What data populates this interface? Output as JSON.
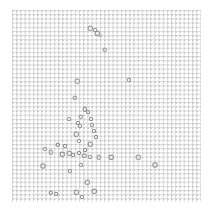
{
  "figure": {
    "width": 211,
    "height": 212,
    "background_color": "#ffffff",
    "title": "",
    "xlabel": "",
    "ylabel": ""
  },
  "plot_area": {
    "left": 12,
    "top": 10,
    "width": 189,
    "height": 192,
    "grid": true,
    "grid_color": "#d5d5d5",
    "grid_spacing_px": 4.2,
    "frame_visible": false
  },
  "chart_data": {
    "type": "scatter",
    "title": "",
    "subtitle": "",
    "xlabel": "",
    "ylabel": "",
    "xlim": [
      0,
      100
    ],
    "ylim": [
      0,
      100
    ],
    "xticklabels": [],
    "yticklabels": [],
    "grid": true,
    "legend": null,
    "legend_position": "none",
    "marker": "square-open",
    "marker_color": "#808080",
    "marker_edge_color": "#6e6e6e",
    "series": [
      {
        "name": "points",
        "color": "#808080",
        "points": [
          {
            "x": 41.3,
            "y": 90.6,
            "size": 4.5,
            "shade": "#8d8d8d"
          },
          {
            "x": 43.9,
            "y": 89.6,
            "size": 4.0,
            "shade": "#9a9a9a"
          },
          {
            "x": 45.2,
            "y": 88.0,
            "size": 4.5,
            "shade": "#838383"
          },
          {
            "x": 46.6,
            "y": 86.5,
            "size": 3.5,
            "shade": "#a5a5a5"
          },
          {
            "x": 49.2,
            "y": 79.2,
            "size": 4.5,
            "shade": "#8a8a8a"
          },
          {
            "x": 34.4,
            "y": 63.0,
            "size": 4.5,
            "shade": "#8f8f8f"
          },
          {
            "x": 61.9,
            "y": 63.5,
            "size": 4.0,
            "shade": "#969696"
          },
          {
            "x": 33.3,
            "y": 54.2,
            "size": 4.5,
            "shade": "#898989"
          },
          {
            "x": 38.6,
            "y": 48.4,
            "size": 4.5,
            "shade": "#7f7f7f"
          },
          {
            "x": 40.2,
            "y": 46.9,
            "size": 4.0,
            "shade": "#8c8c8c"
          },
          {
            "x": 36.5,
            "y": 44.3,
            "size": 4.5,
            "shade": "#888888"
          },
          {
            "x": 41.8,
            "y": 43.2,
            "size": 4.0,
            "shade": "#929292"
          },
          {
            "x": 43.4,
            "y": 37.0,
            "size": 4.0,
            "shade": "#919191"
          },
          {
            "x": 33.9,
            "y": 35.4,
            "size": 4.5,
            "shade": "#858585"
          },
          {
            "x": 35.4,
            "y": 31.8,
            "size": 4.0,
            "shade": "#9b9b9b"
          },
          {
            "x": 41.3,
            "y": 30.2,
            "size": 4.5,
            "shade": "#878787"
          },
          {
            "x": 24.3,
            "y": 29.7,
            "size": 4.5,
            "shade": "#7e7e7e"
          },
          {
            "x": 28.0,
            "y": 29.2,
            "size": 4.0,
            "shade": "#8b8b8b"
          },
          {
            "x": 17.5,
            "y": 27.6,
            "size": 4.0,
            "shade": "#999999"
          },
          {
            "x": 20.6,
            "y": 26.0,
            "size": 4.5,
            "shade": "#8e8e8e"
          },
          {
            "x": 26.5,
            "y": 25.0,
            "size": 4.5,
            "shade": "#7d7d7d"
          },
          {
            "x": 30.2,
            "y": 25.5,
            "size": 4.5,
            "shade": "#848484"
          },
          {
            "x": 32.3,
            "y": 24.5,
            "size": 4.0,
            "shade": "#909090"
          },
          {
            "x": 35.4,
            "y": 25.5,
            "size": 4.0,
            "shade": "#8a8a8a"
          },
          {
            "x": 38.1,
            "y": 24.0,
            "size": 4.5,
            "shade": "#828282"
          },
          {
            "x": 41.3,
            "y": 23.4,
            "size": 4.0,
            "shade": "#959595"
          },
          {
            "x": 46.0,
            "y": 23.4,
            "size": 4.5,
            "shade": "#888888"
          },
          {
            "x": 52.4,
            "y": 23.4,
            "size": 4.5,
            "shade": "#7b7b7b"
          },
          {
            "x": 66.7,
            "y": 23.4,
            "size": 4.5,
            "shade": "#8d8d8d"
          },
          {
            "x": 75.7,
            "y": 19.3,
            "size": 5.0,
            "shade": "#7a7a7a"
          },
          {
            "x": 16.4,
            "y": 18.8,
            "size": 5.0,
            "shade": "#7c7c7c"
          },
          {
            "x": 36.5,
            "y": 19.3,
            "size": 4.0,
            "shade": "#979797"
          },
          {
            "x": 30.7,
            "y": 16.1,
            "size": 4.0,
            "shade": "#949494"
          },
          {
            "x": 39.7,
            "y": 10.4,
            "size": 4.5,
            "shade": "#868686"
          },
          {
            "x": 20.6,
            "y": 4.7,
            "size": 4.5,
            "shade": "#838383"
          },
          {
            "x": 23.3,
            "y": 4.2,
            "size": 4.0,
            "shade": "#8f8f8f"
          },
          {
            "x": 33.9,
            "y": 5.2,
            "size": 4.5,
            "shade": "#898989"
          },
          {
            "x": 43.4,
            "y": 5.7,
            "size": 4.5,
            "shade": "#818181"
          },
          {
            "x": 37.0,
            "y": 2.6,
            "size": 4.0,
            "shade": "#9c9c9c"
          },
          {
            "x": 36.0,
            "y": 39.6,
            "size": 4.0,
            "shade": "#939393"
          },
          {
            "x": 34.9,
            "y": 41.1,
            "size": 4.0,
            "shade": "#8e8e8e"
          },
          {
            "x": 30.2,
            "y": 43.2,
            "size": 4.0,
            "shade": "#989898"
          },
          {
            "x": 38.6,
            "y": 27.1,
            "size": 4.0,
            "shade": "#8c8c8c"
          },
          {
            "x": 44.4,
            "y": 33.9,
            "size": 4.0,
            "shade": "#909090"
          },
          {
            "x": 42.3,
            "y": 40.1,
            "size": 4.0,
            "shade": "#959595"
          }
        ]
      }
    ]
  }
}
